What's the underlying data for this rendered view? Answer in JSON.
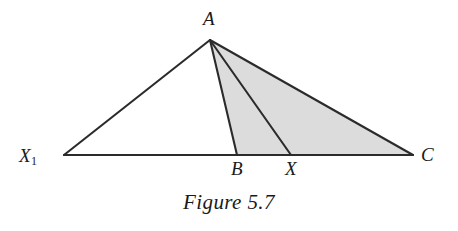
{
  "figure": {
    "caption": "Figure 5.7",
    "background_color": "#ffffff",
    "stroke_color": "#2b2b2b",
    "shade_color": "#dcdcdc",
    "canvas": {
      "width": 458,
      "height": 231
    }
  },
  "labels": {
    "apex": "A",
    "left_base": "X",
    "left_base_subscript": "1",
    "foot_b": "B",
    "foot_x": "X",
    "right_base": "C"
  },
  "chart_data": {
    "type": "diagram",
    "title": "Figure 5.7",
    "points": [
      {
        "name": "A",
        "x": 210,
        "y": 40,
        "label_position": "above"
      },
      {
        "name": "X1",
        "x": 64,
        "y": 155,
        "label_position": "left"
      },
      {
        "name": "B",
        "x": 237,
        "y": 155,
        "label_position": "below"
      },
      {
        "name": "X",
        "x": 291,
        "y": 155,
        "label_position": "below"
      },
      {
        "name": "C",
        "x": 413,
        "y": 155,
        "label_position": "right"
      }
    ],
    "segments": [
      {
        "from": "X1",
        "to": "A",
        "style": "solid"
      },
      {
        "from": "X1",
        "to": "C",
        "style": "solid",
        "note": "base line"
      },
      {
        "from": "A",
        "to": "B",
        "style": "solid"
      },
      {
        "from": "A",
        "to": "X",
        "style": "solid"
      },
      {
        "from": "A",
        "to": "C",
        "style": "solid"
      }
    ],
    "shaded_regions": [
      {
        "vertices": [
          "A",
          "B",
          "C"
        ],
        "fill": "#dcdcdc"
      }
    ],
    "axis_range": {
      "xlim": [
        0,
        458
      ],
      "ylim": [
        0,
        231
      ]
    },
    "grid": false,
    "legend": null
  }
}
